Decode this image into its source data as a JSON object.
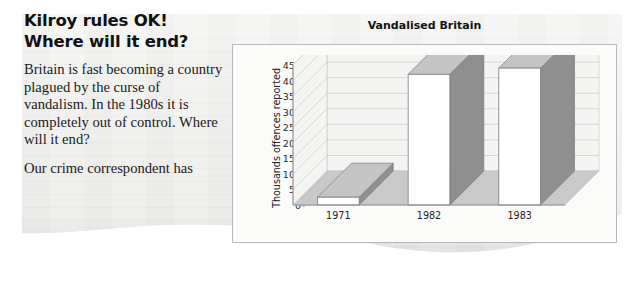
{
  "article": {
    "headline_lines": [
      "Kilroy rules OK!",
      "Where will it end?"
    ],
    "paragraphs": [
      "Britain is fast becoming a country plagued by the curse of vandalism. In the 1980s it is completely out of control. Where will it end?",
      "Our crime correspondent has"
    ]
  },
  "chart_data": {
    "type": "bar",
    "title": "Vandalised Britain",
    "xlabel": "",
    "ylabel": "Thousands offences reported",
    "categories": [
      "1971",
      "1982",
      "1983"
    ],
    "values": [
      25,
      420,
      440
    ],
    "ylim": [
      0,
      450
    ],
    "yticks": [
      0,
      50,
      100,
      150,
      200,
      250,
      300,
      350,
      400,
      450
    ],
    "ytick_labels": [
      "0",
      "50",
      "100",
      "150",
      "200",
      "250",
      "300",
      "350",
      "400",
      "450"
    ],
    "grid": true,
    "legend": "none",
    "style": "3d-column",
    "colors": {
      "bar_front": "#ffffff",
      "bar_side": "#8f8f8f",
      "bar_top": "#c4c4c4",
      "floor": "#c9c9c9",
      "wall": "#f4f4f2",
      "gridline": "#c9c9c9",
      "axis": "#8d8d8d",
      "frame": "#b9b9b9",
      "paper": "#f2f2f0",
      "text": "#111111"
    }
  }
}
